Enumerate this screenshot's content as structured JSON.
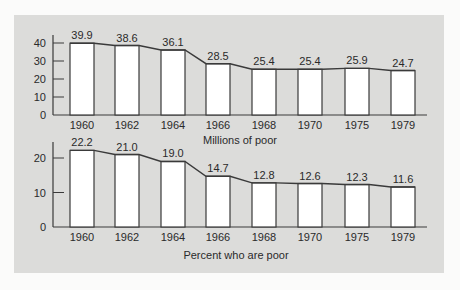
{
  "chart_data": [
    {
      "type": "bar",
      "title": "Millions of poor",
      "xlabel": "Millions of poor",
      "ylabel": "",
      "categories": [
        "1960",
        "1962",
        "1964",
        "1966",
        "1968",
        "1970",
        "1975",
        "1979"
      ],
      "values": [
        39.9,
        38.6,
        36.1,
        28.5,
        25.4,
        25.4,
        25.9,
        24.7
      ],
      "value_labels": [
        "39.9",
        "38.6",
        "36.1",
        "28.5",
        "25.4",
        "25.4",
        "25.9",
        "24.7"
      ],
      "yticks": [
        0,
        10,
        20,
        30,
        40
      ],
      "ylim": [
        0,
        40
      ],
      "grid": false,
      "style": "step-bars connected by sloped lines"
    },
    {
      "type": "bar",
      "title": "Percent who are poor",
      "xlabel": "Percent who are poor",
      "ylabel": "",
      "categories": [
        "1960",
        "1962",
        "1964",
        "1966",
        "1968",
        "1970",
        "1975",
        "1979"
      ],
      "values": [
        22.2,
        21.0,
        19.0,
        14.7,
        12.8,
        12.6,
        12.3,
        11.6
      ],
      "value_labels": [
        "22.2",
        "21.0",
        "19.0",
        "14.7",
        "12.8",
        "12.6",
        "12.3",
        "11.6"
      ],
      "yticks": [
        0,
        10,
        20
      ],
      "ylim": [
        0,
        24
      ],
      "grid": false,
      "style": "step-bars connected by sloped lines"
    }
  ],
  "colors": {
    "panel_bg": "#dcdcda",
    "bar_fill": "#ffffff",
    "line": "#3a3a3a",
    "text": "#2a2a2a"
  }
}
